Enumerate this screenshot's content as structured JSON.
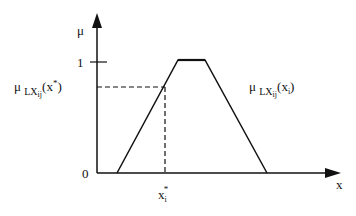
{
  "diagram": {
    "type": "trapezoidal membership function",
    "y_axis": {
      "label": "μ",
      "tick_label": "1",
      "origin_label": "0"
    },
    "x_axis": {
      "label": "x"
    },
    "point_label": {
      "base": "x",
      "sub": "i",
      "sup": "*"
    },
    "membership_at_point_label": {
      "mu": "μ",
      "sub": "LX",
      "subsub": "ij",
      "arg_base": "x",
      "arg_sup": "*",
      "arg_sub": "i"
    },
    "curve_label": {
      "mu": "μ",
      "sub": "LX",
      "subsub": "ij",
      "arg_base": "x",
      "arg_sub": "i"
    },
    "trapezoid": {
      "a": 117,
      "b": 178,
      "c": 205,
      "d": 267,
      "top": 60,
      "base": 173
    },
    "colors": {
      "line": "#111111",
      "background": "#ffffff"
    }
  }
}
